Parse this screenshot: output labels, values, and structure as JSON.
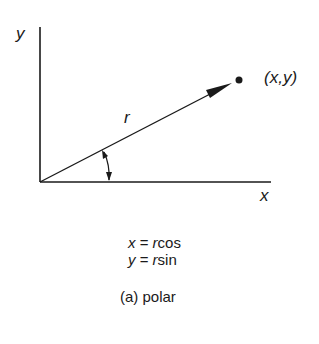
{
  "diagram": {
    "type": "polar-coordinates",
    "axes": {
      "y_label": "y",
      "x_label": "x"
    },
    "vector_label": "r",
    "point_label": "(x,y)",
    "equations": [
      {
        "lhs": "x",
        "op": "=",
        "r": "r",
        "fn": "cos"
      },
      {
        "lhs": "y",
        "op": "=",
        "r": "r",
        "fn": "sin"
      }
    ],
    "caption": "(a) polar"
  }
}
